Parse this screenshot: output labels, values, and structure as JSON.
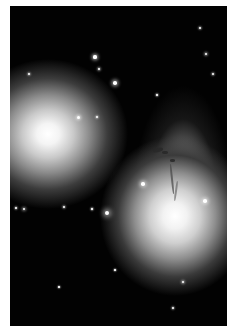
{
  "image": {
    "description": "Deep-space photograph showing two bright elliptical galaxies with diffuse halos, one with a tidal plume and dust lane, surrounded by scattered foreground stars",
    "background_color": "#020202",
    "border_color": "#ffffff"
  },
  "objects": {
    "galaxy_left": {
      "label": "elliptical galaxy (left)",
      "center": [
        48,
        133
      ]
    },
    "galaxy_right": {
      "label": "disturbed galaxy with dust lane (lower right)",
      "center": [
        170,
        217
      ]
    },
    "plume": {
      "label": "tidal plume with dust features"
    }
  },
  "stars": [
    {
      "x": 95,
      "y": 57,
      "r": 1.6
    },
    {
      "x": 99,
      "y": 69,
      "r": 1.1
    },
    {
      "x": 115,
      "y": 83,
      "r": 1.8
    },
    {
      "x": 29,
      "y": 74,
      "r": 1.0
    },
    {
      "x": 78,
      "y": 117,
      "r": 1.5
    },
    {
      "x": 97,
      "y": 117,
      "r": 0.9
    },
    {
      "x": 200,
      "y": 28,
      "r": 1.0
    },
    {
      "x": 206,
      "y": 54,
      "r": 1.2
    },
    {
      "x": 213,
      "y": 74,
      "r": 1.0
    },
    {
      "x": 157,
      "y": 95,
      "r": 0.8
    },
    {
      "x": 143,
      "y": 184,
      "r": 1.8
    },
    {
      "x": 205,
      "y": 201,
      "r": 1.8
    },
    {
      "x": 24,
      "y": 209,
      "r": 1.4
    },
    {
      "x": 16,
      "y": 208,
      "r": 0.9
    },
    {
      "x": 64,
      "y": 207,
      "r": 1.0
    },
    {
      "x": 92,
      "y": 209,
      "r": 0.8
    },
    {
      "x": 107,
      "y": 213,
      "r": 2.4
    },
    {
      "x": 183,
      "y": 282,
      "r": 1.2
    },
    {
      "x": 173,
      "y": 308,
      "r": 0.9
    },
    {
      "x": 115,
      "y": 270,
      "r": 0.7
    },
    {
      "x": 59,
      "y": 287,
      "r": 0.7
    }
  ]
}
